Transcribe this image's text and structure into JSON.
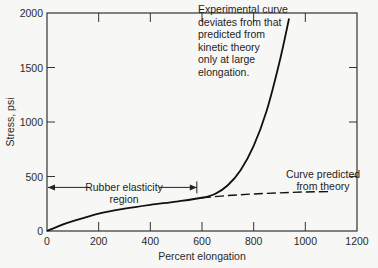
{
  "chart_data": {
    "type": "line",
    "title": "",
    "xlabel": "Percent elongation",
    "ylabel": "Stress, psi",
    "xlim": [
      0,
      1200
    ],
    "ylim": [
      0,
      2000
    ],
    "x_ticks": [
      0,
      200,
      400,
      600,
      800,
      1000,
      1200
    ],
    "y_ticks": [
      0,
      500,
      1000,
      1500,
      2000
    ],
    "grid": false,
    "legend": null,
    "series": [
      {
        "name": "Experimental curve",
        "style": "solid",
        "x": [
          0,
          50,
          100,
          200,
          300,
          400,
          500,
          600,
          650,
          700,
          750,
          800,
          850,
          900,
          937
        ],
        "y": [
          0,
          50,
          90,
          160,
          205,
          240,
          270,
          305,
          340,
          420,
          560,
          780,
          1100,
          1550,
          1950
        ]
      },
      {
        "name": "Curve predicted from theory",
        "style": "dashed",
        "x": [
          600,
          700,
          800,
          900,
          1000,
          1100
        ],
        "y": [
          305,
          325,
          340,
          350,
          358,
          362
        ]
      }
    ],
    "annotations": [
      {
        "id": "experimental",
        "lines": [
          "Experimental curve",
          "deviates from that",
          "predicted from",
          "kinetic theory",
          "only at large",
          "elongation."
        ]
      },
      {
        "id": "theory",
        "lines": [
          "Curve predicted",
          "from theory"
        ]
      },
      {
        "id": "rubber",
        "lines": [
          "Rubber elasticity",
          "region"
        ],
        "range_x": [
          0,
          580
        ],
        "y": 400
      }
    ]
  }
}
